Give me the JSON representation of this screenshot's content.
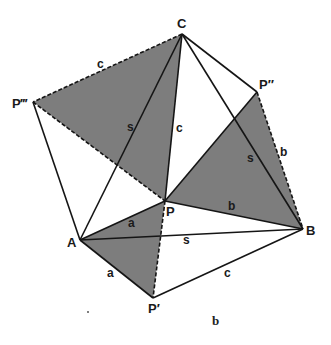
{
  "figure": {
    "caption": "b",
    "colors": {
      "shade": "#7d7d7d",
      "line": "#151515",
      "background": "#ffffff"
    },
    "vertices": {
      "A": {
        "label": "A",
        "x": 80,
        "y": 240
      },
      "B": {
        "label": "B",
        "x": 303,
        "y": 229
      },
      "C": {
        "label": "C",
        "x": 182,
        "y": 34
      },
      "P": {
        "label": "P",
        "x": 165,
        "y": 201
      },
      "P1": {
        "label": "P′",
        "x": 153,
        "y": 298
      },
      "P2": {
        "label": "P″",
        "x": 257,
        "y": 92
      },
      "P3": {
        "label": "P‴",
        "x": 33,
        "y": 102
      }
    },
    "shaded_triangles": [
      [
        "P3",
        "C",
        "P"
      ],
      [
        "P",
        "P2",
        "B"
      ],
      [
        "A",
        "P",
        "P1"
      ]
    ],
    "side_labels": {
      "C_P3": "c",
      "C_A": "s",
      "C_P": "c",
      "C_B": "s",
      "P2_B": "b",
      "P_B": "b",
      "A_B": "s",
      "A_P": "a",
      "A_P1": "a",
      "P1_B": "c"
    }
  }
}
